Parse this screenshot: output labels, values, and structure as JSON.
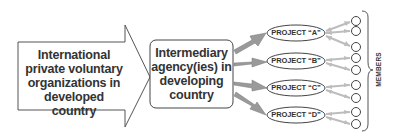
{
  "diagram": {
    "source_box": {
      "label": "International private voluntary organizations in developed country",
      "lines": [
        "International",
        "private voluntary",
        "organizations in",
        "developed country"
      ]
    },
    "intermediary_box": {
      "label": "Intermediary agency(ies) in developing country",
      "lines": [
        "Intermediary",
        "agency(ies) in",
        "developing",
        "country"
      ]
    },
    "projects": [
      {
        "label": "PROJECT “A”"
      },
      {
        "label": "PROJECT “B”"
      },
      {
        "label": "PROJECT “C”"
      },
      {
        "label": "PROJECT “D”"
      }
    ],
    "members_label": "MEMBERS",
    "member_count": 9,
    "colors": {
      "outline": "#444444",
      "text": "#333333",
      "arrow_fill": "#9a9a9a",
      "member_arrow": "#bdbdbd"
    }
  }
}
